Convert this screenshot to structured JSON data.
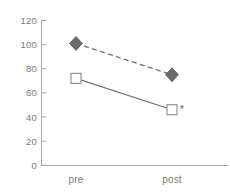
{
  "chart_data": {
    "type": "line",
    "title": "",
    "subtitle": "",
    "xlabel": "",
    "ylabel": "",
    "categories": [
      "pre",
      "post"
    ],
    "x_tick_labels": [
      "pre",
      "post"
    ],
    "y_tick_labels": [
      "0",
      "20",
      "40",
      "60",
      "80",
      "100",
      "120"
    ],
    "y_ticks": [
      0,
      20,
      40,
      60,
      80,
      100,
      120
    ],
    "ylim": [
      0,
      120
    ],
    "grid": false,
    "legend": "none",
    "series": [
      {
        "name": "series-diamond",
        "marker": "diamond",
        "marker_fill": "#6b6b6b",
        "marker_edge": "#555555",
        "line_style": "dashed",
        "line_color": "#6e6e6e",
        "values": [
          101,
          75
        ]
      },
      {
        "name": "series-square",
        "marker": "square",
        "marker_fill": "#ffffff",
        "marker_edge": "#8a8a8a",
        "line_style": "solid",
        "line_color": "#6e6e6e",
        "values": [
          72,
          46
        ]
      }
    ],
    "annotations": [
      {
        "text": "*",
        "name": "significance-asterisk",
        "attached_to": "series-square",
        "at_category": "post",
        "value": 47
      }
    ],
    "axis_color": "#a9a9a9",
    "text_color": "#7c7c7c"
  }
}
